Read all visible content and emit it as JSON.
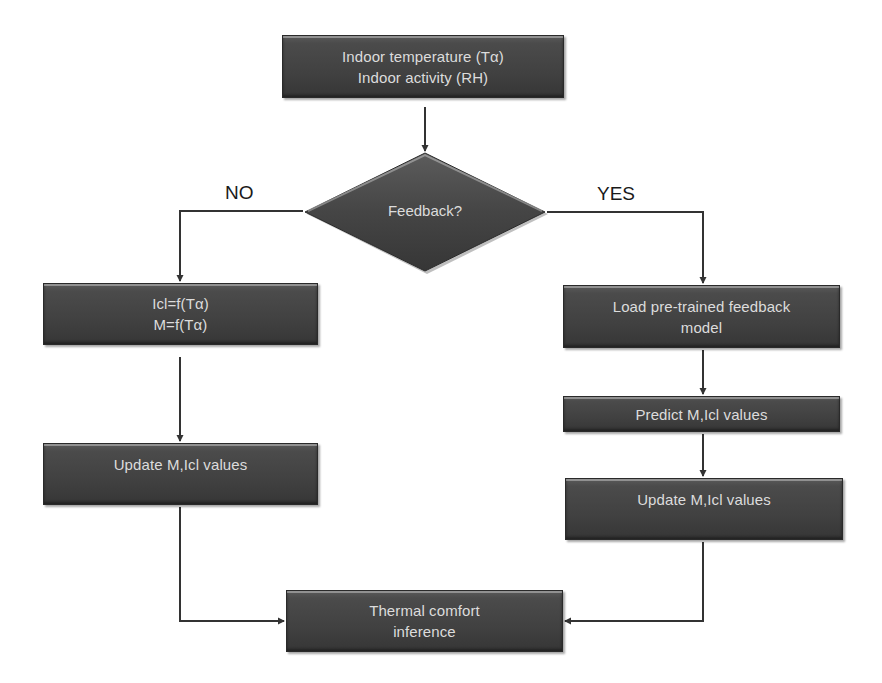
{
  "diagram": {
    "type": "flowchart",
    "colors": {
      "node_fill": "#444444",
      "node_text": "#dcdcdc",
      "connector": "#333333",
      "label_text": "#1a1a1a",
      "background": "#ffffff"
    },
    "nodes": {
      "input": {
        "line1": "Indoor temperature (Tα)",
        "line2": "Indoor activity (RH)"
      },
      "decision": {
        "label": "Feedback?"
      },
      "no_compute": {
        "line1": "Icl=f(Tα)",
        "line2": "M=f(Tα)"
      },
      "no_update": {
        "label": "Update M,Icl values"
      },
      "yes_load": {
        "line1": "Load pre-trained feedback",
        "line2": "model"
      },
      "yes_predict": {
        "label": "Predict M,Icl values"
      },
      "yes_update": {
        "label": "Update M,Icl values"
      },
      "output": {
        "line1": "Thermal comfort",
        "line2": "inference"
      }
    },
    "branch_labels": {
      "no": "NO",
      "yes": "YES"
    },
    "edges": [
      {
        "from": "input",
        "to": "decision"
      },
      {
        "from": "decision",
        "to": "no_compute",
        "label": "NO"
      },
      {
        "from": "decision",
        "to": "yes_load",
        "label": "YES"
      },
      {
        "from": "no_compute",
        "to": "no_update"
      },
      {
        "from": "yes_load",
        "to": "yes_predict"
      },
      {
        "from": "yes_predict",
        "to": "yes_update"
      },
      {
        "from": "no_update",
        "to": "output"
      },
      {
        "from": "yes_update",
        "to": "output"
      }
    ]
  }
}
